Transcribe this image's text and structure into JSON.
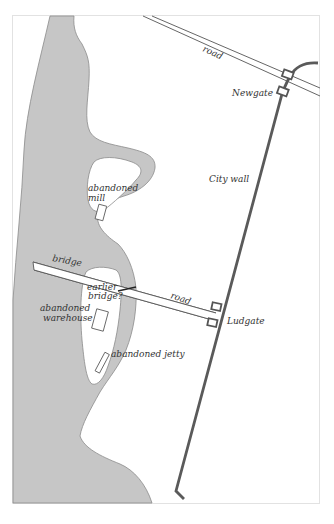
{
  "map": {
    "colors": {
      "background": "#ffffff",
      "water": "#c6c6c6",
      "water_outline": "#8a8a8a",
      "frame": "#e2e2e2",
      "wall": "#5a5a5a",
      "road_line": "#555555",
      "text": "#333333"
    },
    "labels": {
      "road_north": "road",
      "road_south": "road",
      "newgate": "Newgate",
      "city_wall": "City wall",
      "abandoned_mill_line1": "abandoned",
      "abandoned_mill_line2": "mill",
      "bridge": "bridge",
      "earlier_bridge_line1": "earlier",
      "earlier_bridge_line2": "bridge?",
      "abandoned_warehouse_line1": "abandoned",
      "abandoned_warehouse_line2": "warehouse",
      "ludgate": "Ludgate",
      "abandoned_jetty": "abandoned jetty"
    }
  }
}
